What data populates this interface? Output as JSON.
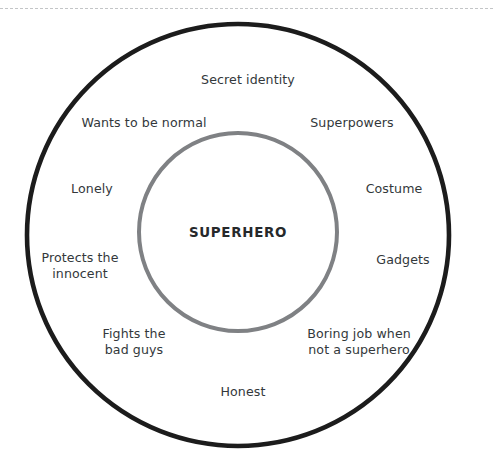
{
  "diagram": {
    "center": {
      "text": "SUPERHERO"
    },
    "rings": {
      "outer": {
        "name": "outer-ring",
        "color": "#1c1c1c",
        "cx": 238,
        "cy": 235,
        "r": 211,
        "stroke_width": 4.6
      },
      "inner": {
        "name": "inner-ring",
        "color": "#7f8184",
        "cx": 238,
        "cy": 232,
        "r": 99,
        "stroke_width": 4.0
      }
    },
    "divider": {
      "style": "dashed",
      "color": "#b9bcbe"
    },
    "labels": [
      {
        "id": "secret-identity",
        "text": "Secret identity",
        "x": 248,
        "y": 80
      },
      {
        "id": "wants-to-be-normal",
        "text": "Wants to be normal",
        "x": 144,
        "y": 123
      },
      {
        "id": "superpowers",
        "text": "Superpowers",
        "x": 352,
        "y": 123
      },
      {
        "id": "lonely",
        "text": "Lonely",
        "x": 92,
        "y": 189
      },
      {
        "id": "costume",
        "text": "Costume",
        "x": 394,
        "y": 189
      },
      {
        "id": "protects-the-innocent",
        "text": "Protects the\ninnocent",
        "x": 80,
        "y": 265
      },
      {
        "id": "gadgets",
        "text": "Gadgets",
        "x": 403,
        "y": 260
      },
      {
        "id": "fights-the-bad-guys",
        "text": "Fights the\nbad guys",
        "x": 134,
        "y": 341
      },
      {
        "id": "boring-job",
        "text": "Boring job when\nnot a superhero",
        "x": 359,
        "y": 341
      },
      {
        "id": "honest",
        "text": "Honest",
        "x": 243,
        "y": 392
      }
    ]
  }
}
